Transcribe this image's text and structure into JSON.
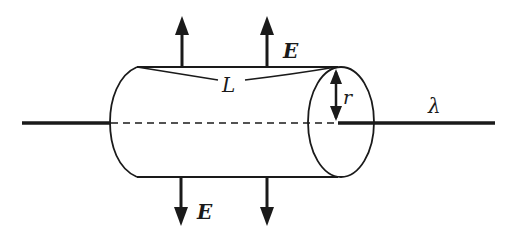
{
  "diagram": {
    "labels": {
      "length": "L",
      "radius": "r",
      "line_charge_density": "λ",
      "field_top": "E",
      "field_bottom": "E"
    },
    "colors": {
      "stroke": "#1a1a1a",
      "background": "#ffffff"
    },
    "elements": {
      "line_charge": "solid horizontal line through cylinder axis",
      "axis_inside": "dashed line inside cylinder",
      "field_arrows_up": 2,
      "field_arrows_down": 2
    }
  }
}
